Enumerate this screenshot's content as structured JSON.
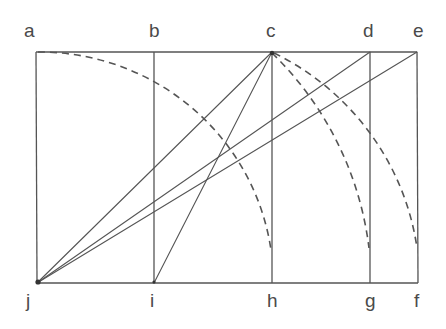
{
  "diagram": {
    "colors": {
      "line": "#555555",
      "label": "#4a4a4a",
      "background": "#ffffff"
    },
    "points": {
      "a": {
        "label": "a",
        "x": 36,
        "y": 52
      },
      "b": {
        "label": "b",
        "x": 154,
        "y": 52
      },
      "c": {
        "label": "c",
        "x": 272,
        "y": 52
      },
      "d": {
        "label": "d",
        "x": 370,
        "y": 52
      },
      "e": {
        "label": "e",
        "x": 417,
        "y": 52
      },
      "f": {
        "label": "f",
        "x": 418,
        "y": 283
      },
      "g": {
        "label": "g",
        "x": 370,
        "y": 283
      },
      "h": {
        "label": "h",
        "x": 272,
        "y": 283
      },
      "i": {
        "label": "i",
        "x": 154,
        "y": 283
      },
      "j": {
        "label": "j",
        "x": 37,
        "y": 283
      }
    },
    "labels": {
      "top": [
        "a",
        "b",
        "c",
        "d",
        "e"
      ],
      "bottom": [
        "j",
        "i",
        "h",
        "g",
        "f"
      ]
    },
    "solid_lines": [
      [
        "a",
        "e"
      ],
      [
        "j",
        "f"
      ],
      [
        "a",
        "j"
      ],
      [
        "b",
        "i"
      ],
      [
        "c",
        "h"
      ],
      [
        "d",
        "g"
      ],
      [
        "e",
        "f"
      ],
      [
        "j",
        "c"
      ],
      [
        "j",
        "d"
      ],
      [
        "j",
        "e"
      ],
      [
        "i",
        "c"
      ]
    ],
    "dashed_arcs": [
      {
        "from": "a",
        "to": "h",
        "center": "j"
      },
      {
        "from": "c",
        "to": "g",
        "center": "j"
      },
      {
        "from": "c",
        "to": "f",
        "center": "i"
      }
    ]
  }
}
